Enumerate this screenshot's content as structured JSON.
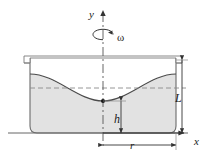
{
  "figure": {
    "type": "physics-diagram",
    "width": 209,
    "height": 161,
    "background_color": "#ffffff",
    "line_color": "#4d4d4d",
    "fluid_fill_color": "#e2e2e2",
    "axis_color": "#333333",
    "dashed_color": "#777777",
    "labels": {
      "y_axis": "y",
      "x_axis": "x",
      "angular_velocity": "ω",
      "depth_L": "L",
      "height_h": "h",
      "radius_r": "r"
    }
  },
  "geometry": {
    "center_x": 103,
    "ground_y": 133,
    "container_left_x": 30,
    "container_right_x": 176,
    "container_top_y": 58,
    "container_bottom_y": 133,
    "rim_outer_left_x": 24,
    "rim_outer_right_x": 182,
    "rim_top_y": 56,
    "rim_bottom_y": 64,
    "vertex_x": 103,
    "vertex_y": 101,
    "surface_edge_y": 74,
    "dashed_level_y": 88,
    "y_axis_top_y": 13,
    "x_axis_right_x": 188,
    "omega_arc_x": 103,
    "omega_arc_y": 36
  },
  "annotations": {
    "L_dimension": {
      "label": "L",
      "from_y": 62,
      "to_y": 133,
      "at_x": 182,
      "meaning": "container fluid depth at rest"
    },
    "h_dimension": {
      "label": "h",
      "from_y": 101,
      "to_y": 133,
      "at_x": 121,
      "meaning": "height of paraboloid vertex above base"
    },
    "r_dimension": {
      "label": "r",
      "from_x": 103,
      "to_x": 176,
      "at_y": 145,
      "meaning": "container radius"
    },
    "rotation_marker": {
      "label": "ω",
      "meaning": "angular velocity about the y axis"
    },
    "vertex_point": {
      "meaning": "lowest point of the free surface on the axis"
    }
  }
}
